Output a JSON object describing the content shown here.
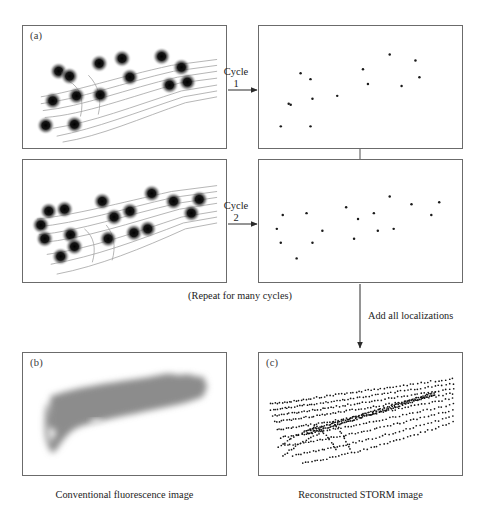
{
  "figure": {
    "header_stub": "",
    "panels": [
      {
        "key": "a_cycle1_raw",
        "label": "(a)",
        "x": 22,
        "y": 25,
        "w": 205,
        "h": 124
      },
      {
        "key": "cycle1_locs",
        "label": "",
        "x": 258,
        "y": 25,
        "w": 205,
        "h": 124
      },
      {
        "key": "cycle2_raw",
        "label": "",
        "x": 22,
        "y": 159,
        "w": 205,
        "h": 124
      },
      {
        "key": "cycle2_locs",
        "label": "",
        "x": 258,
        "y": 159,
        "w": 205,
        "h": 124
      },
      {
        "key": "b_conventional",
        "label": "(b)",
        "x": 22,
        "y": 352,
        "w": 205,
        "h": 124
      },
      {
        "key": "c_storm",
        "label": "(c)",
        "x": 258,
        "y": 352,
        "w": 205,
        "h": 124
      }
    ],
    "arrows": [
      {
        "key": "cycle1-arrow",
        "label_line1": "Cycle",
        "label_line2": "1",
        "x": 233,
        "y": 60
      },
      {
        "key": "cycle2-arrow",
        "label_line1": "Cycle",
        "label_line2": "2",
        "x": 233,
        "y": 196
      }
    ],
    "notes": {
      "repeat_note": "(Repeat for many cycles)",
      "add_localizations": "Add all localizations"
    },
    "captions": {
      "conventional": "Conventional fluorescence image",
      "storm": "Reconstructed STORM image"
    },
    "colors": {
      "panel_border": "#6b6b6b",
      "filament": "#9a9a9a",
      "blob": "#111111",
      "localization_dot": "#1a1a1a",
      "diffuse_fill": "#8c8c8c",
      "text": "#1c1c1c",
      "arrow": "#2a2a2a"
    }
  },
  "chart_data": {
    "type": "scatter",
    "xlabel": "",
    "ylabel": "",
    "panel_a_cycle1_blobs": [
      [
        36,
        46
      ],
      [
        47,
        50
      ],
      [
        77,
        38
      ],
      [
        98,
        33
      ],
      [
        65,
        58
      ],
      [
        110,
        48
      ],
      [
        28,
        62
      ],
      [
        44,
        60
      ],
      [
        66,
        57
      ],
      [
        20,
        82
      ],
      [
        45,
        84
      ],
      [
        128,
        47
      ],
      [
        120,
        30
      ],
      [
        139,
        25
      ],
      [
        26,
        33
      ]
    ],
    "panel_a_cycle2_blobs": [
      [
        18,
        40
      ],
      [
        30,
        36
      ],
      [
        14,
        52
      ],
      [
        18,
        66
      ],
      [
        38,
        60
      ],
      [
        40,
        70
      ],
      [
        28,
        80
      ],
      [
        62,
        32
      ],
      [
        72,
        42
      ],
      [
        84,
        38
      ],
      [
        68,
        58
      ],
      [
        88,
        56
      ],
      [
        100,
        52
      ],
      [
        112,
        38
      ],
      [
        124,
        30
      ],
      [
        136,
        26
      ],
      [
        106,
        28
      ],
      [
        96,
        22
      ]
    ],
    "panel_cycle1_localizations": [
      [
        42,
        40
      ],
      [
        52,
        45
      ],
      [
        52,
        62
      ],
      [
        32,
        68
      ],
      [
        78,
        60
      ],
      [
        104,
        38
      ],
      [
        110,
        50
      ],
      [
        144,
        52
      ],
      [
        158,
        30
      ],
      [
        160,
        44
      ],
      [
        22,
        88
      ],
      [
        52,
        88
      ],
      [
        44,
        62
      ],
      [
        112,
        24
      ]
    ],
    "panel_cycle2_localizations": [
      [
        24,
        48
      ],
      [
        18,
        62
      ],
      [
        48,
        46
      ],
      [
        64,
        62
      ],
      [
        22,
        76
      ],
      [
        54,
        72
      ],
      [
        38,
        88
      ],
      [
        88,
        42
      ],
      [
        100,
        50
      ],
      [
        116,
        46
      ],
      [
        132,
        32
      ],
      [
        154,
        38
      ],
      [
        172,
        38
      ],
      [
        172,
        48
      ],
      [
        120,
        62
      ],
      [
        96,
        70
      ],
      [
        136,
        60
      ]
    ],
    "legend": []
  }
}
